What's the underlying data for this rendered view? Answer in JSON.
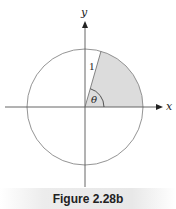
{
  "figure": {
    "caption": "Figure 2.28b",
    "axes": {
      "x_label": "x",
      "y_label": "y"
    },
    "radius_label": "1",
    "angle_label": "θ",
    "circle": {
      "cx": 85,
      "cy": 107,
      "r": 58
    },
    "angle_degrees": 74,
    "colors": {
      "line": "#777777",
      "axis": "#555555",
      "sector_fill": "#dcdcdc",
      "text": "#222222"
    }
  }
}
